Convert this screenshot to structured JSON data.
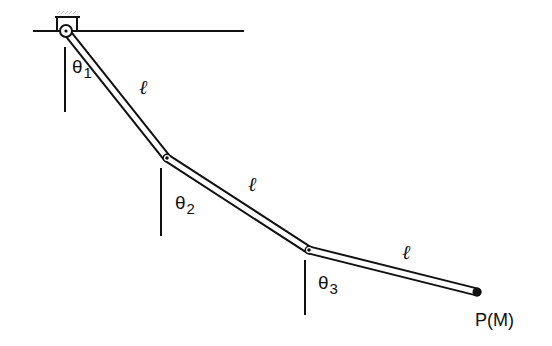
{
  "figure": {
    "type": "triple pendulum diagram",
    "colors": {
      "stroke": "#111111",
      "background": "#ffffff",
      "hatch": "#bbbbbb"
    }
  },
  "ground": {
    "x1": 33,
    "y1": 31,
    "x2": 244,
    "y2": 31
  },
  "pivot": {
    "x": 66,
    "y": 31
  },
  "joints": [
    {
      "x": 66,
      "y": 31
    },
    {
      "x": 167,
      "y": 158
    },
    {
      "x": 309,
      "y": 250
    },
    {
      "x": 477,
      "y": 292
    }
  ],
  "vertical_references": [
    {
      "x": 65,
      "y1": 47,
      "y2": 112
    },
    {
      "x": 161,
      "y1": 168,
      "y2": 236
    },
    {
      "x": 305,
      "y1": 260,
      "y2": 315
    }
  ],
  "labels": {
    "theta1": {
      "symbol": "θ",
      "sub": "1"
    },
    "theta2": {
      "symbol": "θ",
      "sub": "2"
    },
    "theta3": {
      "symbol": "θ",
      "sub": "3"
    },
    "length1": "ℓ",
    "length2": "ℓ",
    "length3": "ℓ",
    "endpoint": "P(M)"
  }
}
